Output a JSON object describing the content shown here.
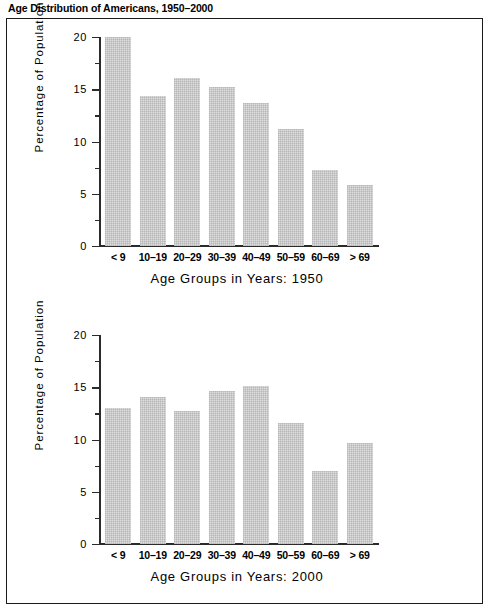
{
  "figure": {
    "title": "Age Distribution of Americans, 1950–2000"
  },
  "chart_data": [
    {
      "id": "chart-1950",
      "type": "bar",
      "title": "",
      "xlabel": "Age Groups in Years:  1950",
      "ylabel": "Percentage of Population",
      "categories": [
        "< 9",
        "10–19",
        "20–29",
        "30–39",
        "40–49",
        "50–59",
        "60–69",
        "> 69"
      ],
      "values": [
        20.0,
        14.4,
        16.1,
        15.2,
        13.7,
        11.2,
        7.3,
        5.8
      ],
      "ylim": [
        0,
        20
      ],
      "yticks": [
        0,
        5,
        10,
        15,
        20
      ],
      "ytick_labels": [
        "0",
        "5",
        "10",
        "15",
        "20"
      ],
      "yminor_step": 2.5,
      "grid": false,
      "legend": "none",
      "bar_color": "#dedede"
    },
    {
      "id": "chart-2000",
      "type": "bar",
      "title": "",
      "xlabel": "Age Groups in Years:  2000",
      "ylabel": "Percentage of Population",
      "categories": [
        "< 9",
        "10–19",
        "20–29",
        "30–39",
        "40–49",
        "50–59",
        "60–69",
        "> 69"
      ],
      "values": [
        13.0,
        14.1,
        12.7,
        14.6,
        15.1,
        11.6,
        7.0,
        9.7
      ],
      "ylim": [
        0,
        20
      ],
      "yticks": [
        0,
        5,
        10,
        15,
        20
      ],
      "ytick_labels": [
        "0",
        "5",
        "10",
        "15",
        "20"
      ],
      "yminor_step": 2.5,
      "grid": false,
      "legend": "none",
      "bar_color": "#dedede"
    }
  ]
}
